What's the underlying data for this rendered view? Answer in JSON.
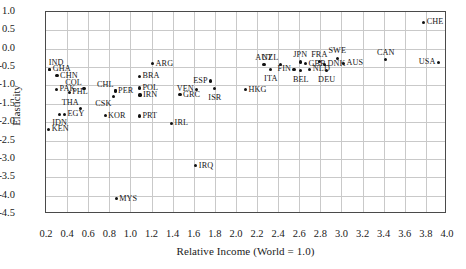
{
  "chart_data": {
    "type": "scatter",
    "title": "",
    "xlabel": "Relative Income (World = 1.0)",
    "ylabel": "Elasticity",
    "xlim": [
      0.2,
      4.0
    ],
    "ylim": [
      -4.5,
      1.0
    ],
    "grid": true,
    "legend": "none",
    "xticks": [
      "0.2",
      "0.4",
      "0.6",
      "0.8",
      "1.0",
      "1.2",
      "1.4",
      "1.6",
      "1.8",
      "2.0",
      "2.2",
      "2.4",
      "2.6",
      "2.8",
      "3.0",
      "3.2",
      "3.4",
      "3.6",
      "3.8",
      "4.0"
    ],
    "xtick_values": [
      0.2,
      0.4,
      0.6,
      0.8,
      1.0,
      1.2,
      1.4,
      1.6,
      1.8,
      2.0,
      2.2,
      2.4,
      2.6,
      2.8,
      3.0,
      3.2,
      3.4,
      3.6,
      3.8,
      4.0
    ],
    "yticks": [
      "1.0",
      "0.5",
      "0.0",
      "-0.5",
      "-1.0",
      "-1.5",
      "-2.0",
      "-2.5",
      "-3.0",
      "-3.5",
      "-4.0",
      "-4.5"
    ],
    "ytick_values": [
      1.0,
      0.5,
      0.0,
      -0.5,
      -1.0,
      -1.5,
      -2.0,
      -2.5,
      -3.0,
      -3.5,
      -4.0,
      -4.5
    ],
    "point_color": "#111111",
    "grid_color": "#c9c9c9",
    "points": [
      {
        "label": "IND",
        "x": 0.235,
        "y": -0.56,
        "pos": "tr"
      },
      {
        "label": "GHA",
        "x": 0.235,
        "y": -0.56,
        "pos": "r"
      },
      {
        "label": "CHN",
        "x": 0.305,
        "y": -0.73,
        "pos": "r"
      },
      {
        "label": "PAK",
        "x": 0.3,
        "y": -1.1,
        "pos": "r"
      },
      {
        "label": "COL",
        "x": 0.56,
        "y": -1.09,
        "pos": "tl"
      },
      {
        "label": "PHL",
        "x": 0.42,
        "y": -1.19,
        "pos": "r"
      },
      {
        "label": "THA",
        "x": 0.53,
        "y": -1.63,
        "pos": "tl"
      },
      {
        "label": "EGY",
        "x": 0.375,
        "y": -1.78,
        "pos": "r"
      },
      {
        "label": "IDN",
        "x": 0.33,
        "y": -1.79,
        "pos": "b"
      },
      {
        "label": "KEN",
        "x": 0.225,
        "y": -2.19,
        "pos": "r"
      },
      {
        "label": "KOR",
        "x": 0.76,
        "y": -1.82,
        "pos": "r"
      },
      {
        "label": "CHL",
        "x": 0.86,
        "y": -1.14,
        "pos": "tl"
      },
      {
        "label": "PER",
        "x": 0.855,
        "y": -1.15,
        "pos": "r"
      },
      {
        "label": "CSK",
        "x": 0.84,
        "y": -1.29,
        "pos": "bl"
      },
      {
        "label": "MYS",
        "x": 0.865,
        "y": -4.08,
        "pos": "r"
      },
      {
        "label": "PRT",
        "x": 1.085,
        "y": -1.83,
        "pos": "r"
      },
      {
        "label": "IRN",
        "x": 1.09,
        "y": -1.26,
        "pos": "r"
      },
      {
        "label": "POL",
        "x": 1.085,
        "y": -1.07,
        "pos": "r"
      },
      {
        "label": "BRA",
        "x": 1.085,
        "y": -0.75,
        "pos": "r"
      },
      {
        "label": "ARG",
        "x": 1.21,
        "y": -0.41,
        "pos": "r"
      },
      {
        "label": "IRL",
        "x": 1.39,
        "y": -2.03,
        "pos": "r"
      },
      {
        "label": "GRC",
        "x": 1.47,
        "y": -1.25,
        "pos": "r"
      },
      {
        "label": "VEN",
        "x": 1.63,
        "y": -1.1,
        "pos": "l"
      },
      {
        "label": "IRQ",
        "x": 1.62,
        "y": -3.18,
        "pos": "r"
      },
      {
        "label": "ESP",
        "x": 1.76,
        "y": -0.88,
        "pos": "l"
      },
      {
        "label": "ISR",
        "x": 1.8,
        "y": -1.09,
        "pos": "b"
      },
      {
        "label": "HKG",
        "x": 2.09,
        "y": -1.12,
        "pos": "r"
      },
      {
        "label": "AUT",
        "x": 2.265,
        "y": -0.43,
        "pos": "t"
      },
      {
        "label": "ITA",
        "x": 2.33,
        "y": -0.57,
        "pos": "b"
      },
      {
        "label": "NZL",
        "x": 2.42,
        "y": -0.42,
        "pos": "tl"
      },
      {
        "label": "FIN",
        "x": 2.55,
        "y": -0.56,
        "pos": "l"
      },
      {
        "label": "JPN",
        "x": 2.61,
        "y": -0.36,
        "pos": "t"
      },
      {
        "label": "BEL",
        "x": 2.615,
        "y": -0.6,
        "pos": "b"
      },
      {
        "label": "GBR",
        "x": 2.66,
        "y": -0.41,
        "pos": "r"
      },
      {
        "label": "NLD",
        "x": 2.7,
        "y": -0.56,
        "pos": "r"
      },
      {
        "label": "FRA",
        "x": 2.79,
        "y": -0.35,
        "pos": "t"
      },
      {
        "label": "DNK",
        "x": 2.84,
        "y": -0.42,
        "pos": "r"
      },
      {
        "label": "DEU",
        "x": 2.86,
        "y": -0.6,
        "pos": "b"
      },
      {
        "label": "SWE",
        "x": 2.96,
        "y": -0.26,
        "pos": "t"
      },
      {
        "label": "AUS",
        "x": 3.02,
        "y": -0.4,
        "pos": "r"
      },
      {
        "label": "CAN",
        "x": 3.42,
        "y": -0.3,
        "pos": "t"
      },
      {
        "label": "USA",
        "x": 3.92,
        "y": -0.37,
        "pos": "l"
      },
      {
        "label": "CHE",
        "x": 3.78,
        "y": 0.72,
        "pos": "r"
      }
    ]
  }
}
